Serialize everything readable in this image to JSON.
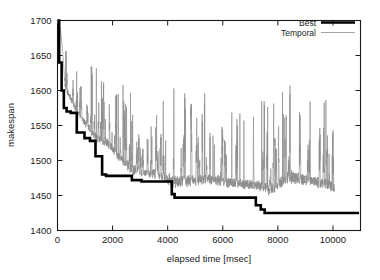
{
  "chart_data": {
    "type": "line",
    "title": "",
    "xlabel": "elapsed time [msec]",
    "ylabel": "makespan",
    "xlim": [
      0,
      11000
    ],
    "ylim": [
      1400,
      1700
    ],
    "xticks": [
      0,
      2000,
      4000,
      6000,
      8000,
      10000
    ],
    "yticks": [
      1400,
      1450,
      1500,
      1550,
      1600,
      1650,
      1700
    ],
    "xtick_labels": [
      "0",
      "2000",
      "4000",
      "6000",
      "8000",
      "10000"
    ],
    "ytick_labels": [
      "1400",
      "1450",
      "1500",
      "1550",
      "1600",
      "1650",
      "1700"
    ],
    "grid": false,
    "legend_position": "top-right",
    "legend": [
      "Best",
      "Temporal"
    ],
    "colors": {
      "best": "#000000",
      "temporal": "#8c8c8c",
      "axis": "#1a1a1a",
      "background": "#ffffff"
    },
    "series": [
      {
        "name": "Best",
        "style": "step-thick-black",
        "x": [
          0,
          60,
          60,
          150,
          150,
          230,
          230,
          330,
          330,
          480,
          480,
          700,
          700,
          980,
          980,
          1180,
          1180,
          1380,
          1380,
          1620,
          1620,
          1760,
          1760,
          2700,
          2700,
          3050,
          3050,
          4150,
          4150,
          4250,
          4250,
          7200,
          7200,
          7380,
          7380,
          7520,
          7520,
          10950
        ],
        "y": [
          1700,
          1700,
          1640,
          1640,
          1600,
          1600,
          1575,
          1575,
          1570,
          1570,
          1568,
          1568,
          1540,
          1540,
          1532,
          1532,
          1528,
          1528,
          1506,
          1506,
          1480,
          1480,
          1478,
          1478,
          1472,
          1472,
          1470,
          1470,
          1452,
          1452,
          1447,
          1447,
          1436,
          1436,
          1430,
          1430,
          1425,
          1425
        ]
      },
      {
        "name": "Temporal",
        "style": "thin-gray-noise",
        "note": "High-frequency sampled makespan trace; oscillates between roughly 1455 and 1645, with spike envelope decaying over elapsed time.",
        "x_range": [
          0,
          10050
        ],
        "y_range": [
          1452,
          1648
        ],
        "baseline_envelope": [
          {
            "x": 0,
            "y": 1700
          },
          {
            "x": 300,
            "y": 1600
          },
          {
            "x": 700,
            "y": 1568
          },
          {
            "x": 1400,
            "y": 1528
          },
          {
            "x": 1800,
            "y": 1520
          },
          {
            "x": 2700,
            "y": 1480
          },
          {
            "x": 3500,
            "y": 1476
          },
          {
            "x": 4300,
            "y": 1462
          },
          {
            "x": 5500,
            "y": 1468
          },
          {
            "x": 6400,
            "y": 1462
          },
          {
            "x": 7200,
            "y": 1460
          },
          {
            "x": 7700,
            "y": 1450
          },
          {
            "x": 8300,
            "y": 1468
          },
          {
            "x": 9200,
            "y": 1466
          },
          {
            "x": 10050,
            "y": 1455
          }
        ],
        "peak_envelope": [
          {
            "x": 300,
            "y": 1660
          },
          {
            "x": 900,
            "y": 1612
          },
          {
            "x": 1250,
            "y": 1645
          },
          {
            "x": 2150,
            "y": 1600
          },
          {
            "x": 2720,
            "y": 1618
          },
          {
            "x": 3350,
            "y": 1562
          },
          {
            "x": 3950,
            "y": 1598
          },
          {
            "x": 4780,
            "y": 1604
          },
          {
            "x": 5420,
            "y": 1592
          },
          {
            "x": 6700,
            "y": 1568
          },
          {
            "x": 7250,
            "y": 1578
          },
          {
            "x": 8000,
            "y": 1594
          },
          {
            "x": 8420,
            "y": 1642
          },
          {
            "x": 9250,
            "y": 1578
          },
          {
            "x": 9760,
            "y": 1604
          }
        ]
      }
    ]
  },
  "axes": {
    "y_axis_label": "makespan",
    "x_axis_label": "elapsed time [msec]"
  },
  "legend": {
    "entries": [
      {
        "label": "Best",
        "key": "best"
      },
      {
        "label": "Temporal",
        "key": "temporal"
      }
    ]
  }
}
